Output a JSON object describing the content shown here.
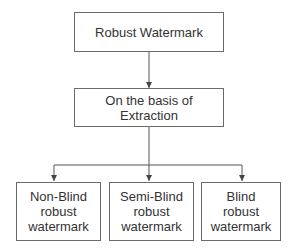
{
  "diagram": {
    "type": "hierarchy",
    "root": {
      "label": "Robust Watermark"
    },
    "level1": {
      "label_line1": "On the basis of",
      "label_line2": "Extraction"
    },
    "leaves": [
      {
        "line1": "Non-Blind",
        "line2": "robust",
        "line3": "watermark"
      },
      {
        "line1": "Semi-Blind",
        "line2": "robust",
        "line3": "watermark"
      },
      {
        "line1": "Blind",
        "line2": "robust",
        "line3": "watermark"
      }
    ],
    "edges": [
      {
        "from": "Robust Watermark",
        "to": "On the basis of Extraction"
      },
      {
        "from": "On the basis of Extraction",
        "to": "Non-Blind robust watermark"
      },
      {
        "from": "On the basis of Extraction",
        "to": "Semi-Blind robust watermark"
      },
      {
        "from": "On the basis of Extraction",
        "to": "Blind robust watermark"
      }
    ],
    "colors": {
      "line": "#555555",
      "border": "#6a6a6a",
      "text": "#333333"
    }
  }
}
